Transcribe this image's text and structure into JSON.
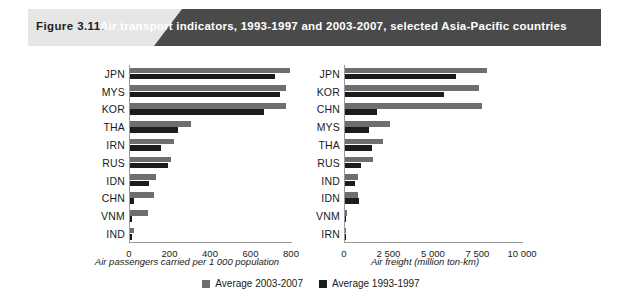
{
  "figure": {
    "number_label": "Figure 3.11.",
    "title": "Air transport indicators, 1993-1997 and 2003-2007, selected Asia-Pacific countries"
  },
  "legend": {
    "items": [
      {
        "label": "Average 2003-2007",
        "color": "#6e6e6e",
        "key": "recent"
      },
      {
        "label": "Average 1993-1997",
        "color": "#1c1c1c",
        "key": "earlier"
      }
    ]
  },
  "colors": {
    "series_recent": "#6e6e6e",
    "series_earlier": "#1c1c1c",
    "banner_dark": "#4a4a4a",
    "banner_light": "#e6e6e6",
    "axis": "#9a9a9a"
  },
  "chart_data": [
    {
      "id": "air-passengers",
      "type": "bar",
      "orientation": "horizontal",
      "title": "",
      "xlabel": "Air passengers carried per 1 000 population",
      "ylabel": "",
      "xlim": [
        0,
        800
      ],
      "xticks": [
        0,
        200,
        400,
        600,
        800
      ],
      "xtick_labels": [
        "0",
        "200",
        "400",
        "600",
        "800"
      ],
      "grid": false,
      "legend_position": "bottom-center",
      "categories": [
        "JPN",
        "MYS",
        "KOR",
        "THA",
        "IRN",
        "RUS",
        "IDN",
        "CHN",
        "VNM",
        "IND"
      ],
      "series": [
        {
          "name": "Average 2003-2007",
          "color": "#6e6e6e",
          "values": [
            790,
            770,
            770,
            300,
            215,
            200,
            130,
            120,
            90,
            20
          ]
        },
        {
          "name": "Average 1993-1997",
          "color": "#1c1c1c",
          "values": [
            715,
            740,
            660,
            235,
            155,
            190,
            95,
            20,
            10,
            8
          ]
        }
      ]
    },
    {
      "id": "air-freight",
      "type": "bar",
      "orientation": "horizontal",
      "title": "",
      "xlabel": "Air freight (million ton-km)",
      "ylabel": "",
      "xlim": [
        0,
        10000
      ],
      "xticks": [
        0,
        2500,
        5000,
        7500,
        10000
      ],
      "xtick_labels": [
        "0",
        "2 500",
        "5 000",
        "7 500",
        "10 000"
      ],
      "grid": false,
      "legend_position": "bottom-center",
      "categories": [
        "JPN",
        "KOR",
        "CHN",
        "MYS",
        "THA",
        "RUS",
        "IND",
        "IDN",
        "VNM",
        "IRN"
      ],
      "series": [
        {
          "name": "Average 2003-2007",
          "color": "#6e6e6e",
          "values": [
            8000,
            7550,
            7700,
            2500,
            2120,
            1560,
            730,
            730,
            110,
            40
          ]
        },
        {
          "name": "Average 1993-1997",
          "color": "#1c1c1c",
          "values": [
            6250,
            5570,
            1800,
            1330,
            1500,
            890,
            560,
            780,
            60,
            25
          ]
        }
      ]
    }
  ]
}
